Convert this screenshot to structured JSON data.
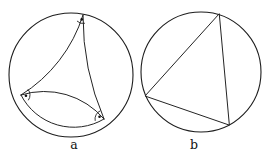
{
  "figure": {
    "background": "#ffffff",
    "stroke_color": "#1d1d1d",
    "label_a": "a",
    "label_b": "b",
    "label_a_pos": [
      74,
      149
    ],
    "label_b_pos": [
      194,
      149
    ],
    "panel_a": {
      "circle": {
        "cx": 71,
        "cy": 75,
        "r": 62
      },
      "vertices": {
        "top": [
          83,
          15
        ],
        "left": [
          21,
          95
        ],
        "right": [
          104,
          119
        ]
      },
      "sides": [
        {
          "from": "top",
          "to": "left",
          "radius": 145,
          "sweep": 1
        },
        {
          "from": "top",
          "to": "right",
          "radius": 260,
          "sweep": 0
        },
        {
          "from": "left",
          "to": "right",
          "radius": 78,
          "sweep": 1
        },
        {
          "from": "left",
          "to": "right",
          "radius": 59,
          "sweep": 0
        }
      ],
      "angle_marks": [
        {
          "vertex": "top",
          "r": 8.5,
          "a1": 77,
          "a2": 135,
          "dot_angle": 106,
          "dot_dist": 4.6,
          "dot_r": 1.3
        },
        {
          "vertex": "left",
          "r": 9,
          "a1": -40,
          "a2": 36,
          "dot_angle": 8,
          "dot_dist": 5,
          "dot_r": 1.3
        },
        {
          "vertex": "right",
          "r": 9,
          "a1": 168,
          "a2": 247,
          "dot_angle": 207,
          "dot_dist": 5,
          "dot_r": 1.3
        }
      ]
    },
    "panel_b": {
      "circle": {
        "cx": 201,
        "cy": 72,
        "r": 60
      },
      "triangle": [
        [
          219,
          14
        ],
        [
          145,
          96
        ],
        [
          229,
          125
        ]
      ]
    }
  }
}
